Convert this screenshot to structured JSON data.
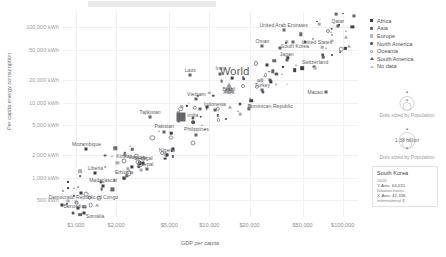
{
  "chart_data": {
    "type": "scatter",
    "title": "",
    "xlabel": "GDP per capita",
    "ylabel": "Per capita energy consumption",
    "xscale": "log",
    "yscale": "log",
    "xlim": [
      800,
      130000
    ],
    "ylim": [
      300,
      160000
    ],
    "grid": true,
    "xticks": [
      1000,
      2000,
      5000,
      10000,
      20000,
      50000,
      100000
    ],
    "xticklabels": [
      "$1,000",
      "$2,000",
      "$5,000",
      "$10,000",
      "$20,000",
      "$50,000",
      "$100,000"
    ],
    "yticks": [
      500,
      1000,
      2000,
      5000,
      10000,
      20000,
      50000,
      100000
    ],
    "yticklabels": [
      "500 kWh",
      "1,000 kWh",
      "2,000 kWh",
      "5,000 kWh",
      "10,000 kWh",
      "20,000 kWh",
      "50,000 kWh",
      "100,000 kWh"
    ],
    "legend_position": "right",
    "legend": [
      {
        "label": "Africa",
        "marker": "square-filled"
      },
      {
        "label": "Asia",
        "marker": "square-mid"
      },
      {
        "label": "Europe",
        "marker": "square-light"
      },
      {
        "label": "North America",
        "marker": "circle-filled"
      },
      {
        "label": "Oceania",
        "marker": "circle-open"
      },
      {
        "label": "South America",
        "marker": "triangle-filled"
      },
      {
        "label": "No data",
        "marker": "triangle-open"
      }
    ],
    "size_legend": {
      "caption": "Dots sized by Population",
      "caption_2": "Dots sized by Population",
      "value_label": "1.38 billion"
    },
    "labeled_points": [
      {
        "name": "Qatar",
        "x": 92000,
        "y": 103000,
        "region": "Asia"
      },
      {
        "name": "United Arab Emirates",
        "x": 36000,
        "y": 92000,
        "region": "Asia"
      },
      {
        "name": "Oman",
        "x": 25000,
        "y": 56000,
        "region": "Asia"
      },
      {
        "name": "United States",
        "x": 52000,
        "y": 63000,
        "region": "North America"
      },
      {
        "name": "South Korea",
        "x": 42336,
        "y": 64231,
        "region": "Asia"
      },
      {
        "name": "Japan",
        "x": 38000,
        "y": 37000,
        "region": "Asia"
      },
      {
        "name": "Switzerland",
        "x": 62000,
        "y": 29000,
        "region": "Europe"
      },
      {
        "name": "Macao",
        "x": 75000,
        "y": 14000,
        "region": "Asia"
      },
      {
        "name": "World",
        "x": 15500,
        "y": 19000,
        "region": "No data"
      },
      {
        "name": "Brazil",
        "x": 14000,
        "y": 15500,
        "region": "South America"
      },
      {
        "name": "Turkey",
        "x": 25000,
        "y": 14500,
        "region": "Asia"
      },
      {
        "name": "Dominican Republic",
        "x": 17000,
        "y": 9500,
        "region": "North America"
      },
      {
        "name": "Laos",
        "x": 7200,
        "y": 23000,
        "region": "Asia"
      },
      {
        "name": "Vanuatu",
        "x": 2900,
        "y": 1600,
        "region": "Oceania"
      },
      {
        "name": "Iran",
        "x": 12000,
        "y": 24000,
        "region": "Asia"
      },
      {
        "name": "Tajikistan",
        "x": 3600,
        "y": 6400,
        "region": "Asia"
      },
      {
        "name": "India",
        "x": 6100,
        "y": 6500,
        "region": "Asia"
      },
      {
        "name": "Pakistan",
        "x": 4600,
        "y": 4100,
        "region": "Asia"
      },
      {
        "name": "Vietnam",
        "x": 8000,
        "y": 11000,
        "region": "Asia"
      },
      {
        "name": "Indonesia",
        "x": 11000,
        "y": 8000,
        "region": "Asia"
      },
      {
        "name": "Philippines",
        "x": 8000,
        "y": 3700,
        "region": "Asia"
      },
      {
        "name": "Nigeria",
        "x": 4800,
        "y": 2000,
        "region": "Africa"
      },
      {
        "name": "Nepal",
        "x": 3400,
        "y": 1300,
        "region": "Asia"
      },
      {
        "name": "Senegal",
        "x": 3200,
        "y": 1550,
        "region": "Africa"
      },
      {
        "name": "Kiribati",
        "x": 2300,
        "y": 1650,
        "region": "Oceania"
      },
      {
        "name": "Mozambique",
        "x": 1200,
        "y": 2400,
        "region": "Africa"
      },
      {
        "name": "Liberia",
        "x": 1400,
        "y": 1150,
        "region": "Africa"
      },
      {
        "name": "Ethiopia",
        "x": 2300,
        "y": 1000,
        "region": "Africa"
      },
      {
        "name": "Madagascar",
        "x": 1600,
        "y": 780,
        "region": "Africa"
      },
      {
        "name": "Democratic Republic of Congo",
        "x": 1100,
        "y": 620,
        "region": "Africa"
      },
      {
        "name": "Burundi",
        "x": 780,
        "y": 430,
        "region": "Africa"
      },
      {
        "name": "Somalia",
        "x": 1150,
        "y": 340,
        "region": "Africa"
      }
    ]
  },
  "tooltip": {
    "country": "South Korea",
    "year": "2020",
    "y_line": "Y-Axis: 64,231",
    "y_unit": "kilowatt-hours",
    "x_line": "X-Axis: 42,336",
    "x_unit": "international $"
  }
}
